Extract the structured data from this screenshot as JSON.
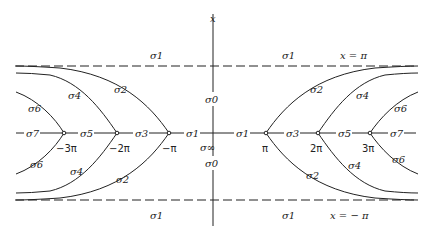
{
  "diagram": {
    "axis_label": "x",
    "top_asymptote_label": "x = π",
    "bottom_asymptote_label": "x = − π",
    "branch_points": [
      "−3π",
      "−2π",
      "−π",
      "π",
      "2π",
      "3π"
    ],
    "center_labels": {
      "upper": "σ0",
      "lower": "σ0",
      "origin": "σ∞"
    },
    "region_labels_top": [
      "σ1",
      "σ1"
    ],
    "region_labels_bottom": [
      "σ1",
      "σ1"
    ],
    "axis_segment_labels_left": [
      "σ7",
      "σ5",
      "σ3",
      "σ1"
    ],
    "axis_segment_labels_right": [
      "σ1",
      "σ3",
      "σ5",
      "σ7"
    ],
    "curve_labels_upper_left": [
      "σ6",
      "σ4",
      "σ2"
    ],
    "curve_labels_lower_left": [
      "σ6",
      "σ4",
      "σ2"
    ],
    "curve_labels_upper_right": [
      "σ2",
      "σ4",
      "σ6"
    ],
    "curve_labels_lower_right": [
      "σ2",
      "σ4",
      "σ6"
    ],
    "colors": {
      "line": "#222222",
      "background": "#ffffff"
    }
  }
}
